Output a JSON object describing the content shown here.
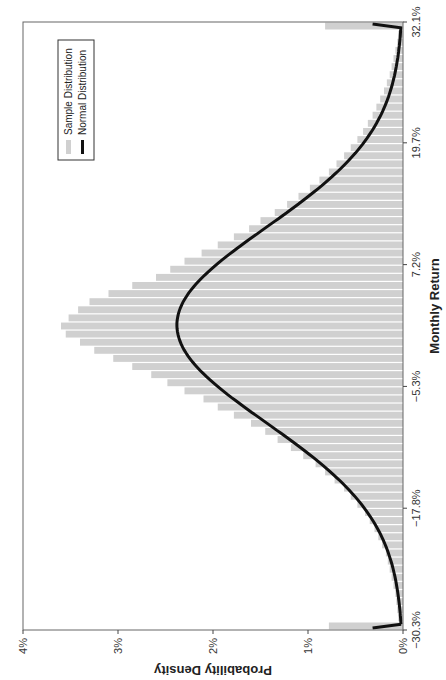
{
  "chart_data": {
    "type": "bar",
    "title": "",
    "xlabel": "Monthly Return",
    "ylabel": "Probability Density",
    "xlim": [
      -30.3,
      32.1
    ],
    "ylim": [
      0,
      4
    ],
    "x_ticks": [
      "−30.3%",
      "−17.8%",
      "−5.3%",
      "7.2%",
      "19.7%",
      "32.1%"
    ],
    "x_tick_values": [
      -30.3,
      -17.8,
      -5.3,
      7.2,
      19.7,
      32.1
    ],
    "y_ticks": [
      "0%",
      "1%",
      "2%",
      "3%",
      "4%"
    ],
    "y_tick_values": [
      0,
      1,
      2,
      3,
      4
    ],
    "grid": false,
    "legend_position": "upper right",
    "orientation_note": "figure rotated 90 degrees counter-clockwise",
    "series": [
      {
        "name": "Sample Distribution",
        "type": "bar",
        "color": "#d0d0d0",
        "bin_centers": [
          -29.9,
          -29.1,
          -28.2,
          -27.4,
          -26.6,
          -25.7,
          -24.9,
          -24.1,
          -23.2,
          -22.4,
          -21.6,
          -20.7,
          -19.9,
          -19.1,
          -18.2,
          -17.4,
          -16.6,
          -15.7,
          -14.9,
          -14.1,
          -13.2,
          -12.4,
          -11.6,
          -10.7,
          -9.9,
          -9.1,
          -8.2,
          -7.4,
          -6.6,
          -5.7,
          -4.9,
          -4.1,
          -3.2,
          -2.4,
          -1.6,
          -0.7,
          0.1,
          0.9,
          1.8,
          2.6,
          3.4,
          4.3,
          5.1,
          5.9,
          6.8,
          7.6,
          8.4,
          9.3,
          10.1,
          10.9,
          11.8,
          12.6,
          13.4,
          14.3,
          15.1,
          15.9,
          16.8,
          17.6,
          18.4,
          19.3,
          20.1,
          20.9,
          21.8,
          22.6,
          23.4,
          24.3,
          25.1,
          25.9,
          26.8,
          27.6,
          28.4,
          29.3,
          30.1,
          30.9,
          31.7
        ],
        "values": [
          0.78,
          0.05,
          0.06,
          0.07,
          0.08,
          0.1,
          0.12,
          0.14,
          0.16,
          0.18,
          0.22,
          0.26,
          0.3,
          0.35,
          0.4,
          0.48,
          0.55,
          0.62,
          0.72,
          0.82,
          0.92,
          1.05,
          1.18,
          1.32,
          1.45,
          1.6,
          1.78,
          1.95,
          2.1,
          2.3,
          2.48,
          2.65,
          2.85,
          3.05,
          3.25,
          3.4,
          3.55,
          3.6,
          3.52,
          3.42,
          3.3,
          3.1,
          2.85,
          2.6,
          2.45,
          2.3,
          2.12,
          1.95,
          1.78,
          1.62,
          1.5,
          1.35,
          1.22,
          1.1,
          0.98,
          0.88,
          0.78,
          0.7,
          0.62,
          0.55,
          0.48,
          0.42,
          0.37,
          0.32,
          0.28,
          0.24,
          0.2,
          0.17,
          0.14,
          0.12,
          0.1,
          0.08,
          0.06,
          0.05,
          0.82
        ]
      },
      {
        "name": "Normal Distribution",
        "type": "line",
        "color": "#111111",
        "mean": 1.0,
        "peak": 2.38,
        "sd_estimate": 10.0
      }
    ]
  },
  "legend": {
    "items": [
      {
        "label": "Sample Distribution",
        "swatch": "#d0d0d0"
      },
      {
        "label": "Normal Distribution",
        "swatch": "#111111"
      }
    ]
  }
}
